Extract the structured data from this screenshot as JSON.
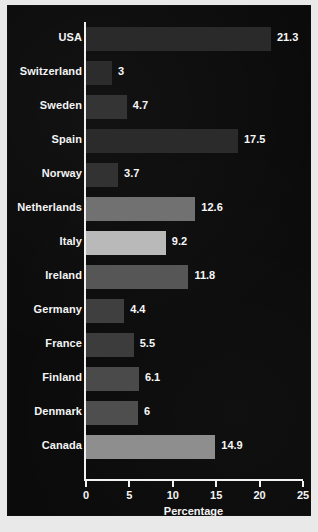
{
  "figure": {
    "background_color": "#0a0a0a",
    "text_color": "#f4f4f4",
    "frame_color": "#e9e9e9"
  },
  "chart_data": {
    "type": "bar",
    "orientation": "horizontal",
    "title": "",
    "subtitle": "",
    "xlabel": "Percentage",
    "ylabel": "",
    "xlim": [
      0,
      25
    ],
    "ylim": null,
    "grid": false,
    "legend": null,
    "xticks": [
      0,
      5,
      10,
      15,
      20,
      25
    ],
    "xtick_labels": [
      "0",
      "5",
      "10",
      "15",
      "20",
      "25"
    ],
    "categories": [
      "USA",
      "Switzerland",
      "Sweden",
      "Spain",
      "Norway",
      "Netherlands",
      "Italy",
      "Ireland",
      "Germany",
      "France",
      "Finland",
      "Denmark",
      "Canada"
    ],
    "values": [
      21.3,
      3,
      4.7,
      17.5,
      3.7,
      12.6,
      9.2,
      11.8,
      4.4,
      5.5,
      6.1,
      6,
      14.9
    ],
    "value_labels": [
      "21.3",
      "3",
      "4.7",
      "17.5",
      "3.7",
      "12.6",
      "9.2",
      "11.8",
      "4.4",
      "5.5",
      "6.1",
      "6",
      "14.9"
    ],
    "bar_colors": [
      "#2a2a2a",
      "#2c2c2c",
      "#343434",
      "#2b2b2b",
      "#323232",
      "#717171",
      "#b9b9b9",
      "#565656",
      "#3f3f3f",
      "#3c3c3c",
      "#4a4a4a",
      "#4e4e4e",
      "#8e8e8e"
    ]
  }
}
